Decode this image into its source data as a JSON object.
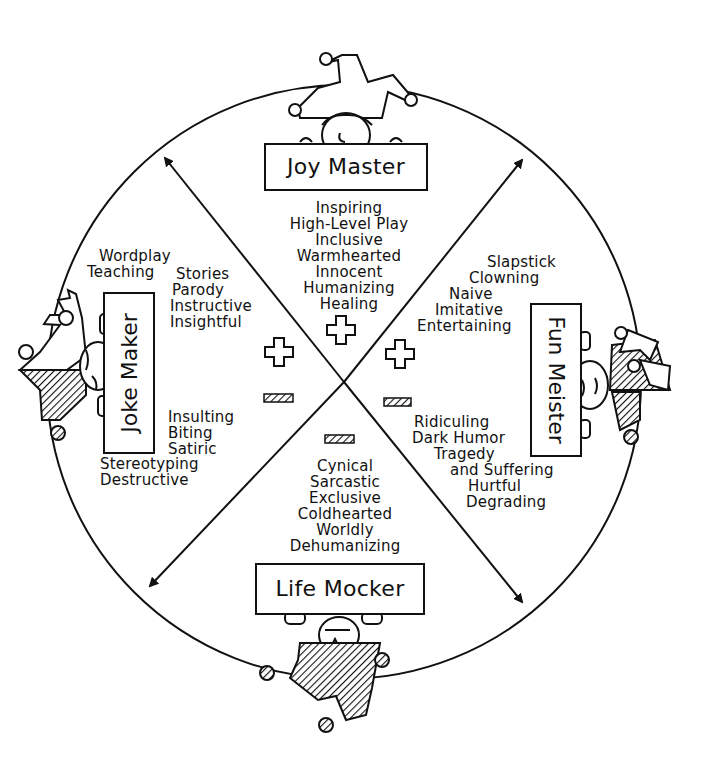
{
  "diagram": {
    "type": "humor-styles-circle",
    "colors": {
      "ink": "#111111",
      "paper": "#ffffff"
    },
    "quadrants": {
      "top": {
        "character": "Joy Master",
        "sign_symbol": "plus",
        "traits": [
          "Inspiring",
          "High-Level Play",
          "Inclusive",
          "Warmhearted",
          "Innocent",
          "Humanizing",
          "Healing"
        ]
      },
      "left": {
        "character": "Joke Maker",
        "positive_traits_col1": [
          "Wordplay",
          "Teaching"
        ],
        "positive_traits_col2": [
          "Stories",
          "Parody",
          "Instructive",
          "Insightful"
        ],
        "negative_traits_a": [
          "Insulting",
          "Biting",
          "Satiric"
        ],
        "negative_traits_b": [
          "Stereotyping",
          "Destructive"
        ]
      },
      "right": {
        "character": "Fun Meister",
        "positive_traits": [
          "Slapstick",
          "Clowning",
          "Naive",
          "Imitative",
          "Entertaining"
        ],
        "negative_traits": [
          "Ridiculing",
          "Dark Humor",
          "Tragedy",
          "and Suffering",
          "Hurtful",
          "Degrading"
        ]
      },
      "bottom": {
        "character": "Life Mocker",
        "sign_symbol": "minus",
        "traits": [
          "Cynical",
          "Sarcastic",
          "Exclusive",
          "Coldhearted",
          "Worldly",
          "Dehumanizing"
        ]
      }
    },
    "symbols": {
      "plus": [
        "top",
        "left",
        "right"
      ],
      "minus": [
        "left",
        "right",
        "bottom"
      ]
    }
  }
}
